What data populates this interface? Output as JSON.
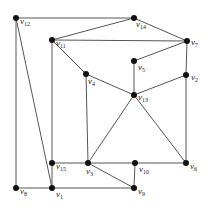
{
  "diagram": {
    "type": "graph",
    "node_color": "#111111",
    "edge_color": "#555555",
    "nodes": [
      {
        "id": "v12",
        "base": "v",
        "sub": "12",
        "x": 16,
        "y": 18,
        "lx": 4,
        "ly": 6
      },
      {
        "id": "v14",
        "base": "v",
        "sub": "14",
        "x": 134,
        "y": 18,
        "lx": 2,
        "ly": 9
      },
      {
        "id": "v11",
        "base": "v",
        "sub": "11",
        "x": 52,
        "y": 40,
        "lx": 4,
        "ly": 6
      },
      {
        "id": "v7",
        "base": "v",
        "sub": "7",
        "x": 187,
        "y": 41,
        "lx": 4,
        "ly": 4
      },
      {
        "id": "v5",
        "base": "v",
        "sub": "5",
        "x": 134,
        "y": 61,
        "lx": 4,
        "ly": 9
      },
      {
        "id": "v4",
        "base": "v",
        "sub": "4",
        "x": 86,
        "y": 74,
        "lx": 2,
        "ly": 10
      },
      {
        "id": "v2",
        "base": "v",
        "sub": "2",
        "x": 186,
        "y": 75,
        "lx": 5,
        "ly": 5
      },
      {
        "id": "v13",
        "base": "v",
        "sub": "13",
        "x": 134,
        "y": 95,
        "lx": 4,
        "ly": 5
      },
      {
        "id": "v15",
        "base": "v",
        "sub": "15",
        "x": 52,
        "y": 163,
        "lx": 4,
        "ly": 6
      },
      {
        "id": "v3",
        "base": "v",
        "sub": "3",
        "x": 88,
        "y": 163,
        "lx": -2,
        "ly": 11
      },
      {
        "id": "v10",
        "base": "v",
        "sub": "10",
        "x": 135,
        "y": 163,
        "lx": 4,
        "ly": 9
      },
      {
        "id": "v6",
        "base": "v",
        "sub": "6",
        "x": 186,
        "y": 163,
        "lx": 4,
        "ly": 6
      },
      {
        "id": "v8",
        "base": "v",
        "sub": "8",
        "x": 16,
        "y": 188,
        "lx": 4,
        "ly": 6
      },
      {
        "id": "v1",
        "base": "v",
        "sub": "1",
        "x": 52,
        "y": 188,
        "lx": 4,
        "ly": 9
      },
      {
        "id": "v9",
        "base": "v",
        "sub": "9",
        "x": 134,
        "y": 188,
        "lx": 4,
        "ly": 6
      }
    ],
    "edges": [
      [
        "v12",
        "v14"
      ],
      [
        "v12",
        "v8"
      ],
      [
        "v12",
        "v1"
      ],
      [
        "v14",
        "v11"
      ],
      [
        "v14",
        "v7"
      ],
      [
        "v11",
        "v7"
      ],
      [
        "v11",
        "v15"
      ],
      [
        "v11",
        "v4"
      ],
      [
        "v4",
        "v13"
      ],
      [
        "v4",
        "v3"
      ],
      [
        "v5",
        "v7"
      ],
      [
        "v5",
        "v13"
      ],
      [
        "v13",
        "v2"
      ],
      [
        "v2",
        "v7"
      ],
      [
        "v2",
        "v6"
      ],
      [
        "v13",
        "v3"
      ],
      [
        "v13",
        "v6"
      ],
      [
        "v15",
        "v3"
      ],
      [
        "v15",
        "v1"
      ],
      [
        "v3",
        "v10"
      ],
      [
        "v10",
        "v6"
      ],
      [
        "v10",
        "v9"
      ],
      [
        "v3",
        "v9"
      ],
      [
        "v8",
        "v1"
      ],
      [
        "v1",
        "v9"
      ]
    ]
  }
}
